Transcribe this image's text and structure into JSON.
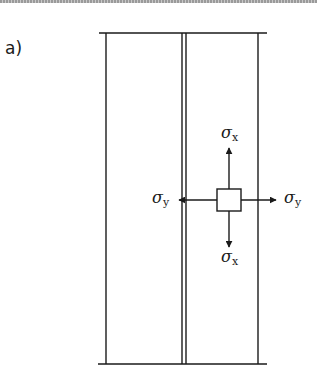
{
  "figure": {
    "panel_label": "a)",
    "stress_element": {
      "symbol": "σ",
      "labels": {
        "top": {
          "symbol": "σ",
          "subscript": "x"
        },
        "bottom": {
          "symbol": "σ",
          "subscript": "x"
        },
        "left": {
          "symbol": "σ",
          "subscript": "y"
        },
        "right": {
          "symbol": "σ",
          "subscript": "y"
        }
      }
    },
    "colors": {
      "stroke": "#1a1a1a",
      "background": "#ffffff",
      "border": "#9a9a9a"
    }
  }
}
